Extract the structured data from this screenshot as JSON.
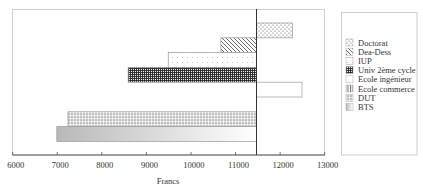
{
  "chart_data": {
    "type": "bar",
    "orientation": "horizontal",
    "title": "",
    "xlabel": "Francs",
    "ylabel": "",
    "xlim": [
      6000,
      13000
    ],
    "xticks": [
      6000,
      7000,
      8000,
      9000,
      10000,
      11000,
      12000,
      13000
    ],
    "xtick_labels": [
      "6000",
      "7000",
      "8000",
      "9000",
      "10000",
      "11000",
      "12000",
      "13000"
    ],
    "reference_value": 11470,
    "grid": false,
    "legend_position": "right",
    "categories": [
      "Doctorat",
      "Dea-Dess",
      "IUP",
      "Univ 2ème cycle",
      "Ecole ingénieur",
      "Ecole commerce",
      "DUT",
      "BTS"
    ],
    "values": [
      12280,
      10670,
      9490,
      8590,
      12490,
      11470,
      7240,
      6990
    ],
    "patterns": [
      "dots-sparse",
      "diagonal-hatch",
      "dots-fine",
      "dense-grid",
      "none",
      "vertical-lines",
      "checker",
      "gradient-gray"
    ],
    "note": "Bars extend from the reference line at ~11470 Francs to each category value"
  },
  "legend": {
    "items": [
      {
        "label": "Doctorat",
        "pattern": "dots-sparse"
      },
      {
        "label": "Dea-Dess",
        "pattern": "diagonal-hatch"
      },
      {
        "label": "IUP",
        "pattern": "dots-fine"
      },
      {
        "label": "Univ 2ème cycle",
        "pattern": "dense-grid"
      },
      {
        "label": "Ecole ingénieur",
        "pattern": "none"
      },
      {
        "label": "Ecole commerce",
        "pattern": "vertical-lines"
      },
      {
        "label": "DUT",
        "pattern": "checker"
      },
      {
        "label": "BTS",
        "pattern": "gradient-gray"
      }
    ]
  },
  "colors": {
    "frame": "#c8c8c8",
    "axis": "#555555",
    "bar_stroke": "#9a9a9a",
    "reference_line": "#333333"
  }
}
